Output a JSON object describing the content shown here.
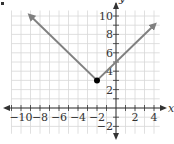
{
  "bullet": "•",
  "chart_data": {
    "type": "line",
    "title": "",
    "function": "y = |x + 2| + 3",
    "xlabel": "x",
    "ylabel": "y",
    "xlim": [
      -11,
      4.6
    ],
    "ylim": [
      -2.8,
      10.6
    ],
    "grid": true,
    "x_ticks": [
      -10,
      -8,
      -6,
      -4,
      -2,
      2,
      4
    ],
    "y_ticks": [
      -2,
      2,
      4,
      6,
      8,
      10
    ],
    "x_tick_labels": [
      "−10",
      "−8",
      "−6",
      "−4",
      "−2",
      "2",
      "4"
    ],
    "y_tick_labels": [
      "−2",
      "2",
      "4",
      "6",
      "8",
      "10"
    ],
    "series": [
      {
        "name": "absolute value function",
        "points": [
          [
            -9,
            10
          ],
          [
            -2,
            3
          ],
          [
            4,
            9
          ]
        ],
        "arrow_ends": true,
        "color": "#808080"
      }
    ],
    "vertex": {
      "x": -2,
      "y": 3,
      "color": "#000000"
    },
    "colors": {
      "grid": "#d8d8d8",
      "axis": "#333333"
    }
  }
}
